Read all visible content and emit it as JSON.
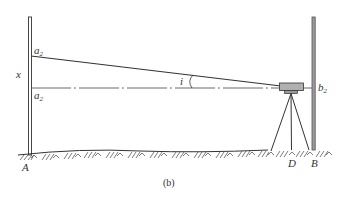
{
  "figure": {
    "caption": "(b)",
    "labels": {
      "a_top": {
        "base": "a",
        "sub": "2"
      },
      "a_bottom": {
        "base": "a",
        "sub": "2"
      },
      "x": "x",
      "angle": "i",
      "b_right": {
        "base": "b",
        "sub": "2"
      },
      "point_A": "A",
      "point_D": "D",
      "point_B": "B"
    },
    "colors": {
      "line": "#333333",
      "staff_fill": "#9a9a9a",
      "instrument_fill": "#b0b0b0"
    }
  }
}
